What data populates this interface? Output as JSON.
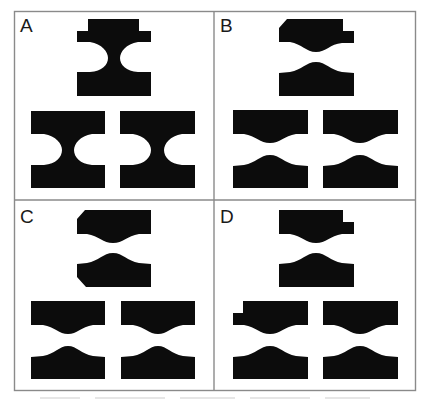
{
  "figure": {
    "layout": "2x2 grid of panels",
    "ink_color": "#0c0c0c",
    "frame_color": "#8a8a8a",
    "background": "#ffffff",
    "panels": [
      {
        "label": "A",
        "description": "Top: tabbed shape with semicircular notches on both sides; bottom: two blocks with semicircular side notches",
        "shapes": [
          "tabbed-notched-block",
          "notched-block",
          "notched-block"
        ]
      },
      {
        "label": "B",
        "description": "Separated upper/lower pieces with curved mating faces; top upper piece has chamfered corner and right step",
        "shapes": [
          "chamfered-stepped-upper",
          "bumped-lower",
          "upper",
          "lower",
          "upper",
          "lower"
        ]
      },
      {
        "label": "C",
        "description": "Separated upper/lower pieces; top pair has chamfered left corners on both pieces",
        "shapes": [
          "chamfered-upper",
          "chamfered-lower",
          "upper",
          "lower",
          "upper",
          "lower"
        ]
      },
      {
        "label": "D",
        "description": "Separated upper/lower pieces; top upper piece has right step, bottom-left upper piece has left step",
        "shapes": [
          "right-stepped-upper",
          "lower",
          "left-stepped-upper",
          "lower",
          "upper",
          "lower"
        ]
      }
    ]
  }
}
